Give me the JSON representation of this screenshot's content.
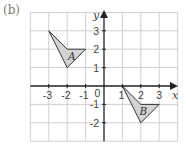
{
  "part_label": "(b)",
  "axes": {
    "x_label": "x",
    "y_label": "y",
    "x_ticks": [
      "-3",
      "-2",
      "-1",
      "0",
      "1",
      "2",
      "3"
    ],
    "y_ticks": [
      "3",
      "2",
      "1",
      "-1",
      "-2"
    ],
    "x_range": [
      -4,
      4
    ],
    "y_range": [
      -3,
      4
    ]
  },
  "shapes": [
    {
      "label": "A",
      "vertices": [
        [
          -3,
          3
        ],
        [
          -2,
          2
        ],
        [
          -1,
          2
        ],
        [
          -2,
          1
        ]
      ],
      "fill": "#d4d4d4"
    },
    {
      "label": "B",
      "vertices": [
        [
          1,
          0
        ],
        [
          2,
          -1
        ],
        [
          3,
          -1
        ],
        [
          2,
          -2
        ]
      ],
      "fill": "#d4d4d4"
    }
  ],
  "colors": {
    "grid": "#cfcfcf",
    "axis": "#222222",
    "shape_stroke": "#333333",
    "shape_fill": "#d4d4d4"
  }
}
